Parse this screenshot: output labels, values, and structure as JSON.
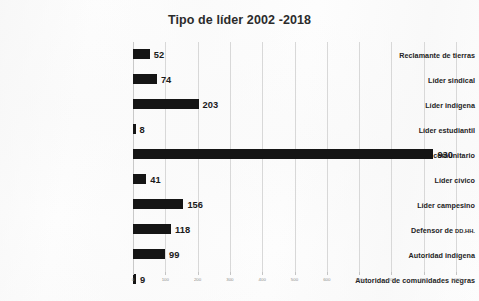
{
  "chart_data": {
    "type": "bar",
    "orientation": "horizontal",
    "title": "Tipo de líder 2002 -2018",
    "xlabel": "",
    "ylabel": "",
    "xlim": [
      0,
      1000
    ],
    "grid": true,
    "legend": false,
    "xticks": [
      "0",
      "100",
      "200",
      "300",
      "400",
      "500",
      "600",
      "700",
      "800",
      "900",
      "1000"
    ],
    "xtick_values": [
      0,
      100,
      200,
      300,
      400,
      500,
      600,
      700,
      800,
      900,
      1000
    ],
    "categories": [
      "Reclamante de tierras",
      "Líder sindical",
      "Líder indígena",
      "Líder estudiantil",
      "Líder comunitario",
      "Líder cívico",
      "Líder campesino",
      "Defensor de DD.HH.",
      "Autoridad indígena",
      "Autoridad de comunidades negras"
    ],
    "values": [
      52,
      74,
      203,
      8,
      930,
      41,
      156,
      118,
      99,
      9
    ],
    "bar_color": "#151515",
    "grid_color": "#d8d8d8",
    "text_color": "#232323"
  },
  "rows": [
    {
      "label": "Reclamante de tierras",
      "label_main": "Reclamante de tierras",
      "label_abbr": "",
      "value": 52,
      "value_text": "52"
    },
    {
      "label": "Líder sindical",
      "label_main": "Líder sindical",
      "label_abbr": "",
      "value": 74,
      "value_text": "74"
    },
    {
      "label": "Líder indígena",
      "label_main": "Líder indígena",
      "label_abbr": "",
      "value": 203,
      "value_text": "203"
    },
    {
      "label": "Líder estudiantil",
      "label_main": "Líder estudiantil",
      "label_abbr": "",
      "value": 8,
      "value_text": "8"
    },
    {
      "label": "Líder comunitario",
      "label_main": "Líder comunitario",
      "label_abbr": "",
      "value": 930,
      "value_text": "930"
    },
    {
      "label": "Líder cívico",
      "label_main": "Líder cívico",
      "label_abbr": "",
      "value": 41,
      "value_text": "41"
    },
    {
      "label": "Líder campesino",
      "label_main": "Líder campesino",
      "label_abbr": "",
      "value": 156,
      "value_text": "156"
    },
    {
      "label": "Defensor de DD.HH.",
      "label_main": "Defensor de ",
      "label_abbr": "DD.HH.",
      "value": 118,
      "value_text": "118"
    },
    {
      "label": "Autoridad indígena",
      "label_main": "Autoridad indígena",
      "label_abbr": "",
      "value": 99,
      "value_text": "99"
    },
    {
      "label": "Autoridad de comunidades negras",
      "label_main": "Autoridad de comunidades negras",
      "label_abbr": "",
      "value": 9,
      "value_text": "9"
    }
  ]
}
